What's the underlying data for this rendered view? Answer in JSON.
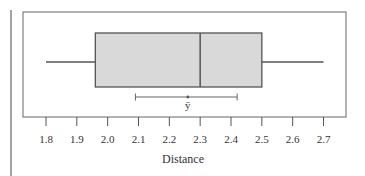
{
  "chart_data": {
    "type": "boxplot",
    "title": "",
    "xlabel": "Distance",
    "ylabel": "",
    "xlim": [
      1.8,
      2.7
    ],
    "x_ticks": [
      1.8,
      1.9,
      2.0,
      2.1,
      2.2,
      2.3,
      2.4,
      2.5,
      2.6,
      2.7
    ],
    "x_tick_labels": [
      "1.8",
      "1.9",
      "2.0",
      "2.1",
      "2.2",
      "2.3",
      "2.4",
      "2.5",
      "2.6",
      "2.7"
    ],
    "grid": false,
    "box": {
      "min": 1.8,
      "q1": 1.96,
      "median": 2.3,
      "q3": 2.5,
      "max": 2.7
    },
    "mean_interval": {
      "label": "ȳ",
      "mean": 2.26,
      "lower": 2.09,
      "upper": 2.42
    },
    "colors": {
      "box_fill": "#d9d9d9",
      "line": "#555555",
      "frame": "#666666"
    }
  },
  "labels": {
    "xlabel": "Distance",
    "mean_symbol": "ȳ"
  }
}
